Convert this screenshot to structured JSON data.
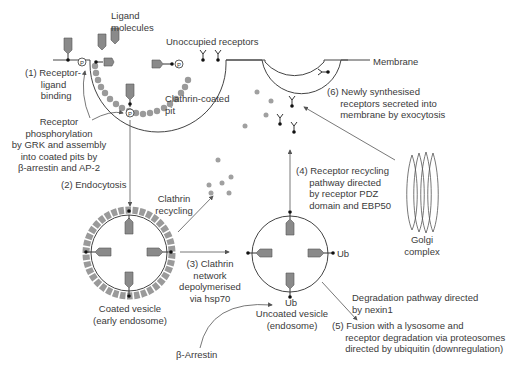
{
  "labels": {
    "ligand_molecules": "Ligand\nmolecules",
    "unoccupied_receptors": "Unoccupied receptors",
    "membrane": "Membrane",
    "step1": "(1) Receptor-\n      ligand\n      binding",
    "clathrin_coated_pit": "Clathrin-coated\npit",
    "receptor_phosphorylation": "Receptor\nphosphorylation\nby GRK and assembly\ninto coated pits by\nβ-arrestin and AP-2",
    "step2": "(2) Endocytosis",
    "clathrin_recycling": "Clathrin\nrecycling",
    "coated_vesicle": "Coated vesicle\n(early endosome)",
    "step3": "(3) Clathrin\nnetwork\ndepolymerised\nvia hsp70",
    "step4": "(4) Receptor recycling\n     pathway directed\n     by receptor PDZ\n     domain and EBP50",
    "step6": "(6) Newly synthesised\n     receptors secreted into\n     membrane by exocytosis",
    "golgi": "Golgi\ncomplex",
    "ub_right": "Ub",
    "ub_bottom": "Ub",
    "uncoated_vesicle": "Uncoated vesicle\n(endosome)",
    "degradation": "Degradation pathway directed\nby nexin1",
    "step5": "(5) Fusion with a lysosome and\n     receptor degradation via proteosomes\n     directed by ubiquitin (downregulation)",
    "beta_arrestin": "β-Arrestin",
    "phospho_symbol": "P"
  },
  "colors": {
    "line": "#444444",
    "clathrin": "#9a9a9a",
    "ligand": "#8a8a8a",
    "text": "#3a3a3a"
  }
}
